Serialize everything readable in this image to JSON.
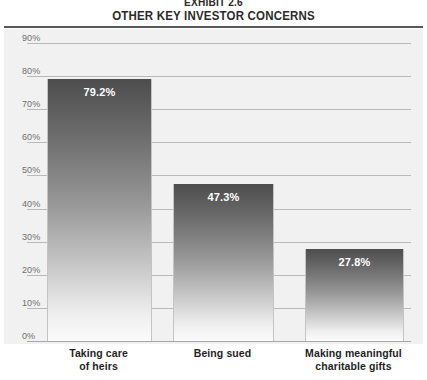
{
  "chart_data": {
    "type": "bar",
    "exhibit_label": "EXHIBIT 2.6",
    "title": "OTHER KEY INVESTOR CONCERNS",
    "subtitle": "",
    "xlabel": "",
    "ylabel": "",
    "grid": true,
    "legend": "none",
    "ylim": [
      0,
      90
    ],
    "ytick_labels": [
      "90%",
      "80%",
      "70%",
      "60%",
      "50%",
      "40%",
      "30%",
      "20%",
      "10%",
      "0%"
    ],
    "ytick_values": [
      90,
      80,
      70,
      60,
      50,
      40,
      30,
      20,
      10,
      0
    ],
    "categories": [
      "Taking care of heirs",
      "Being sued",
      "Making meaningful charitable gifts"
    ],
    "category_lines": [
      [
        "Taking care",
        "of heirs"
      ],
      [
        "Being sued",
        ""
      ],
      [
        "Making meaningful",
        "charitable gifts"
      ]
    ],
    "values": [
      79.2,
      47.3,
      27.8
    ],
    "value_labels": [
      "79.2%",
      "47.3%",
      "27.8%"
    ],
    "colors": {
      "bar_top": "#4d4d4d",
      "bar_bottom": "#fbfbfb",
      "plot_background": "#f1f1f1",
      "gridline": "#b9b9b9",
      "title_text": "#2b2b2b",
      "tick_text": "#6e6e6e",
      "value_label_text": "#ffffff",
      "rule": "#585858"
    }
  }
}
